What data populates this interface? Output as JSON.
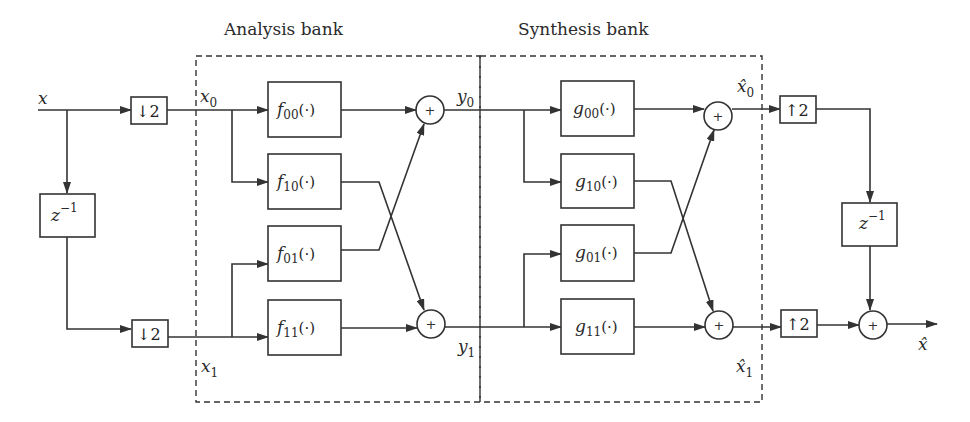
{
  "diagram": {
    "type": "two-channel polyphase filter bank block diagram",
    "sections": {
      "analysis": {
        "title": "Analysis bank"
      },
      "synthesis": {
        "title": "Synthesis bank"
      }
    },
    "signals": {
      "input": "x",
      "x0": {
        "base": "x",
        "sub": "0"
      },
      "x1": {
        "base": "x",
        "sub": "1"
      },
      "y0": {
        "base": "y",
        "sub": "0"
      },
      "y1": {
        "base": "y",
        "sub": "1"
      },
      "xhat0": {
        "base": "x̂",
        "sub": "0"
      },
      "xhat1": {
        "base": "x̂",
        "sub": "1"
      },
      "output": "x̂"
    },
    "operators": {
      "downsample": "↓2",
      "upsample": "↑2",
      "delay": {
        "base": "z",
        "sup": "−1"
      },
      "sum": "+"
    },
    "analysis_filters": [
      {
        "base": "f",
        "sub": "00",
        "arg": "(·)"
      },
      {
        "base": "f",
        "sub": "10",
        "arg": "(·)"
      },
      {
        "base": "f",
        "sub": "01",
        "arg": "(·)"
      },
      {
        "base": "f",
        "sub": "11",
        "arg": "(·)"
      }
    ],
    "synthesis_filters": [
      {
        "base": "g",
        "sub": "00",
        "arg": "(·)"
      },
      {
        "base": "g",
        "sub": "10",
        "arg": "(·)"
      },
      {
        "base": "g",
        "sub": "01",
        "arg": "(·)"
      },
      {
        "base": "g",
        "sub": "11",
        "arg": "(·)"
      }
    ],
    "colors": {
      "stroke": "#333333",
      "text": "#2a2a2a",
      "background": "#ffffff"
    }
  }
}
